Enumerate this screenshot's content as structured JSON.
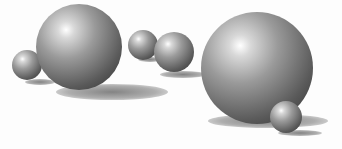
{
  "scene": {
    "description": "3D rendered glossy gray spheres on white ground with cast shadows",
    "background": "#fdfdfd",
    "spheres": [
      {
        "name": "small-left-sphere",
        "cx": 27,
        "cy": 65,
        "r": 15
      },
      {
        "name": "large-left-sphere",
        "cx": 79,
        "cy": 47,
        "r": 43
      },
      {
        "name": "medium-sphere-a",
        "cx": 143,
        "cy": 45,
        "r": 15
      },
      {
        "name": "medium-sphere-b",
        "cx": 174,
        "cy": 52,
        "r": 20
      },
      {
        "name": "large-right-sphere",
        "cx": 257,
        "cy": 68,
        "r": 56
      },
      {
        "name": "tiny-front-sphere",
        "cx": 286,
        "cy": 117,
        "r": 16
      }
    ],
    "shadows": [
      {
        "name": "shadow-small-left",
        "cx": 40,
        "cy": 82,
        "w": 30,
        "h": 6
      },
      {
        "name": "shadow-large-left",
        "cx": 112,
        "cy": 92,
        "w": 112,
        "h": 16
      },
      {
        "name": "shadow-medium-a",
        "cx": 150,
        "cy": 59,
        "w": 24,
        "h": 5
      },
      {
        "name": "shadow-medium-b",
        "cx": 183,
        "cy": 74,
        "w": 46,
        "h": 7
      },
      {
        "name": "shadow-large-right",
        "cx": 268,
        "cy": 121,
        "w": 120,
        "h": 14
      },
      {
        "name": "shadow-tiny-front",
        "cx": 300,
        "cy": 133,
        "w": 44,
        "h": 6
      }
    ]
  }
}
